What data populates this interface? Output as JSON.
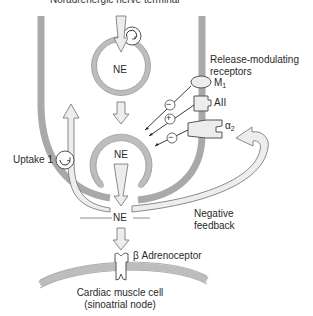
{
  "title": "Noradrenergic nerve terminal",
  "labels": {
    "vesicle_top": "NE",
    "vesicle_mid": "NE",
    "cleft_ne": "NE",
    "release_modulating_line1": "Release-modulating",
    "release_modulating_line2": "receptors",
    "m1": "M",
    "m1_sub": "1",
    "aii": "AII",
    "alpha2": "α",
    "alpha2_sub": "2",
    "uptake1": "Uptake 1",
    "negative_feedback_line1": "Negative",
    "negative_feedback_line2": "feedback",
    "beta_adrenoceptor": "β Adrenoceptor",
    "cardiac_line1": "Cardiac muscle cell",
    "cardiac_line2": "(sinoatrial node)"
  },
  "signs": {
    "m1_effect": "−",
    "aii_effect": "+",
    "alpha2_effect": "−"
  },
  "colors": {
    "membrane": "#a9a9a9",
    "vesicle_fill": "#e6e6e6",
    "vesicle_stroke": "#8c8c8c",
    "arrow_fill": "#ededed",
    "arrow_stroke": "#6e6e6e",
    "text": "#2a2a2a"
  }
}
